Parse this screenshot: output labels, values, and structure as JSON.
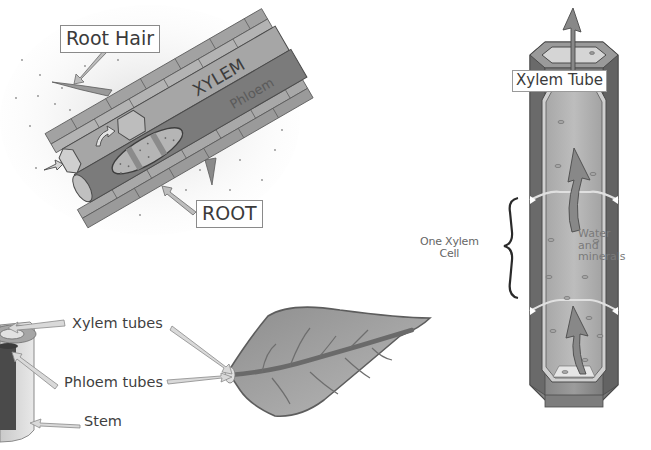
{
  "diagram": {
    "root_panel": {
      "labels": {
        "root_hair": "Root Hair",
        "root": "ROOT",
        "xylem": "XYLEM",
        "phloem": "Phloem"
      }
    },
    "xylem_tube_panel": {
      "labels": {
        "title": "Xylem Tube",
        "one_xylem_cell_line1": "One Xylem",
        "one_xylem_cell_line2": "Cell",
        "water_line1": "Water",
        "water_line2": "and",
        "water_line3": "minerals"
      }
    },
    "stem_leaf_panel": {
      "labels": {
        "xylem_tubes": "Xylem tubes",
        "phloem_tubes": "Phloem tubes",
        "stem": "Stem"
      }
    },
    "colors": {
      "background": "#ffffff",
      "dark_tissue": "#6e6e6e",
      "mid_tissue": "#9a9a9a",
      "light_tissue": "#c8c8c8",
      "outline": "#4a4a4a",
      "label_text": "#3b3b3b"
    }
  }
}
